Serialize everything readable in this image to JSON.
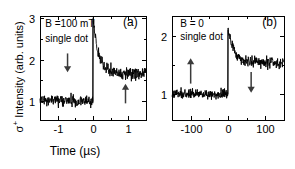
{
  "figure": {
    "background_color": "#ffffff",
    "trace_color": "#000000",
    "arrow_color": "#3b3b3b",
    "y_axis_label_prefix": "σ",
    "y_axis_label_superscript": "+",
    "y_axis_label_rest": " Intensity (arb. units)"
  },
  "chart_data": [
    {
      "type": "line",
      "panel_tag": "(a)",
      "title": "",
      "xlabel": "Time (µs)",
      "ylabel": "σ+ Intensity (arb. units)",
      "xlim": [
        -1.5,
        1.5
      ],
      "ylim": [
        0.55,
        3.05
      ],
      "xticks": [
        -1,
        0,
        1
      ],
      "xticklabels": [
        "-1",
        "0",
        "1"
      ],
      "yticks": [
        1,
        2,
        3
      ],
      "yticklabels": [
        "1",
        "2",
        "3"
      ],
      "grid": false,
      "legend": false,
      "annotations": [
        {
          "text": "B =100 mT",
          "x": -1.35,
          "y": 2.78
        },
        {
          "text": "single dot",
          "x": -1.35,
          "y": 2.42
        },
        {
          "text": "(a)",
          "x": 0.85,
          "y": 2.8
        }
      ],
      "arrows": [
        {
          "direction": "down",
          "x": -0.72,
          "y_from": 2.15,
          "y_to": 1.7
        },
        {
          "direction": "up",
          "x": 0.92,
          "y_from": 0.95,
          "y_to": 1.42
        }
      ],
      "series": [
        {
          "name": "sigma-plus intensity",
          "description": "Flat baseline at 1.0 for t<0, sharp rise to peak 3.0 at t=0, fast decay to plateau at 1.68",
          "baseline_level": 1.0,
          "peak_level": 3.0,
          "plateau_level": 1.68,
          "noise_amplitude": 0.09,
          "decay_constant_us": 0.16,
          "step_time": 0.0
        }
      ]
    },
    {
      "type": "line",
      "panel_tag": "(b)",
      "title": "",
      "xlabel": "Time (µs)",
      "ylabel": "",
      "xlim": [
        -150,
        150
      ],
      "ylim": [
        0.55,
        2.35
      ],
      "xticks": [
        -100,
        0,
        100
      ],
      "xticklabels": [
        "-100",
        "0",
        "100"
      ],
      "yticks": [
        1,
        2
      ],
      "yticklabels": [
        "1",
        "2"
      ],
      "grid": false,
      "legend": false,
      "annotations": [
        {
          "text": "B = 0",
          "x": -128,
          "y": 2.16
        },
        {
          "text": "single dot",
          "x": -128,
          "y": 1.93
        },
        {
          "text": "(b)",
          "x": 92,
          "y": 2.17
        }
      ],
      "arrows": [
        {
          "direction": "up",
          "x": -100,
          "y_from": 1.18,
          "y_to": 1.62
        },
        {
          "direction": "down",
          "x": 62,
          "y_from": 1.38,
          "y_to": 1.02
        }
      ],
      "series": [
        {
          "name": "sigma-plus intensity",
          "description": "Flat baseline at 1.0 for t<0, sharp rise to peak 2.1 at t=0, decay to plateau at 1.54",
          "baseline_level": 1.0,
          "peak_level": 2.1,
          "plateau_level": 1.54,
          "noise_amplitude": 0.055,
          "decay_constant_us": 18,
          "step_time": 0
        }
      ]
    }
  ]
}
